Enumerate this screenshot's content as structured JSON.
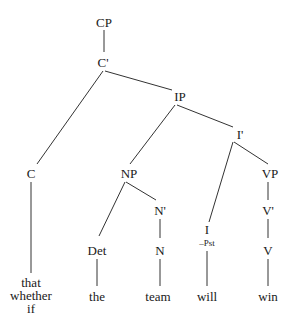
{
  "diagram": {
    "type": "syntax-tree",
    "nodes": [
      {
        "id": "CP",
        "label": "CP",
        "x": 104,
        "y": 22
      },
      {
        "id": "Cbar",
        "label": "C'",
        "x": 103,
        "y": 62
      },
      {
        "id": "IP",
        "label": "IP",
        "x": 180,
        "y": 96
      },
      {
        "id": "Ibar",
        "label": "I'",
        "x": 240,
        "y": 134
      },
      {
        "id": "C",
        "label": "C",
        "x": 31,
        "y": 173
      },
      {
        "id": "NP",
        "label": "NP",
        "x": 129,
        "y": 173
      },
      {
        "id": "VP",
        "label": "VP",
        "x": 270,
        "y": 173
      },
      {
        "id": "Nbar",
        "label": "N'",
        "x": 160,
        "y": 210
      },
      {
        "id": "Vbar",
        "label": "V'",
        "x": 268,
        "y": 210
      },
      {
        "id": "Det",
        "label": "Det",
        "x": 97,
        "y": 250
      },
      {
        "id": "N",
        "label": "N",
        "x": 160,
        "y": 250
      },
      {
        "id": "I",
        "label": "I",
        "x": 207,
        "y": 229
      },
      {
        "id": "V",
        "label": "V",
        "x": 268,
        "y": 250
      }
    ],
    "features": [
      {
        "node": "I",
        "label": "–Pst",
        "x": 207,
        "y": 243
      }
    ],
    "words": [
      {
        "id": "comp-words",
        "lines": [
          "that",
          "whether",
          "if"
        ],
        "x": 31,
        "y": 295
      },
      {
        "id": "the",
        "lines": [
          "the"
        ],
        "x": 97,
        "y": 296
      },
      {
        "id": "team",
        "lines": [
          "team"
        ],
        "x": 158,
        "y": 296
      },
      {
        "id": "will",
        "lines": [
          "will"
        ],
        "x": 207,
        "y": 296
      },
      {
        "id": "win",
        "lines": [
          "win"
        ],
        "x": 268,
        "y": 296
      }
    ],
    "edges": [
      {
        "from": "CP",
        "to": "Cbar",
        "x1": 104,
        "y1": 30,
        "x2": 104,
        "y2": 52
      },
      {
        "from": "Cbar",
        "to": "C",
        "x1": 103,
        "y1": 71,
        "x2": 37,
        "y2": 164
      },
      {
        "from": "Cbar",
        "to": "IP",
        "x1": 105,
        "y1": 71,
        "x2": 172,
        "y2": 90
      },
      {
        "from": "IP",
        "to": "NP",
        "x1": 175,
        "y1": 105,
        "x2": 130,
        "y2": 164
      },
      {
        "from": "IP",
        "to": "Ibar",
        "x1": 177,
        "y1": 105,
        "x2": 233,
        "y2": 127
      },
      {
        "from": "Ibar",
        "to": "I",
        "x1": 233,
        "y1": 142,
        "x2": 209,
        "y2": 222
      },
      {
        "from": "Ibar",
        "to": "VP",
        "x1": 234,
        "y1": 142,
        "x2": 268,
        "y2": 164
      },
      {
        "from": "C",
        "to": "comp-words",
        "x1": 31,
        "y1": 182,
        "x2": 31,
        "y2": 273
      },
      {
        "from": "NP",
        "to": "Det",
        "x1": 125,
        "y1": 182,
        "x2": 99,
        "y2": 236
      },
      {
        "from": "NP",
        "to": "Nbar",
        "x1": 126,
        "y1": 182,
        "x2": 156,
        "y2": 200
      },
      {
        "from": "Nbar",
        "to": "N",
        "x1": 160,
        "y1": 219,
        "x2": 160,
        "y2": 238
      },
      {
        "from": "VP",
        "to": "Vbar",
        "x1": 268,
        "y1": 182,
        "x2": 268,
        "y2": 200
      },
      {
        "from": "Vbar",
        "to": "V",
        "x1": 268,
        "y1": 219,
        "x2": 268,
        "y2": 238
      },
      {
        "from": "Det",
        "to": "the",
        "x1": 97,
        "y1": 259,
        "x2": 97,
        "y2": 286
      },
      {
        "from": "N",
        "to": "team",
        "x1": 160,
        "y1": 259,
        "x2": 160,
        "y2": 286
      },
      {
        "from": "I",
        "to": "will",
        "x1": 207,
        "y1": 251,
        "x2": 207,
        "y2": 286
      },
      {
        "from": "V",
        "to": "win",
        "x1": 268,
        "y1": 259,
        "x2": 268,
        "y2": 286
      }
    ],
    "line_color": "#333333",
    "text_color": "#1a1a1a"
  }
}
